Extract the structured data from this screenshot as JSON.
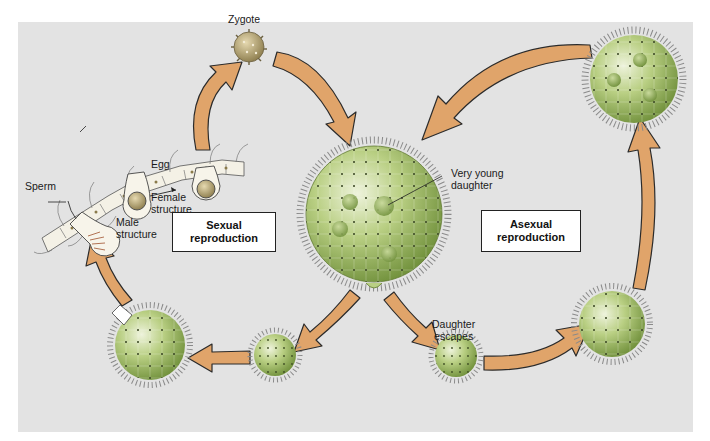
{
  "diagram": {
    "background_color": "#e3e3e3",
    "arrow_fill": "#e0a46a",
    "arrow_stroke": "#2b2b2b",
    "colony_fill": "#a9c46a",
    "colony_shade": "#6f8f3a",
    "cilia_color": "#7a7a7a",
    "daughter_fill": "#86a84c"
  },
  "labels": {
    "zygote": "Zygote",
    "egg": "Egg",
    "sperm": "Sperm",
    "female_structure_1": "Female",
    "female_structure_2": "structure",
    "male_structure_1": "Male",
    "male_structure_2": "structure",
    "very_young_daughter_1": "Very young",
    "very_young_daughter_2": "daughter",
    "daughter_escapes_1": "Daughter",
    "daughter_escapes_2": "escapes"
  },
  "boxes": {
    "sexual": {
      "line1": "Sexual",
      "line2": "reproduction"
    },
    "asexual": {
      "line1": "Asexual",
      "line2": "reproduction"
    }
  },
  "stages": [
    {
      "id": "zygote",
      "cx": 249,
      "cy": 47,
      "r": 16
    },
    {
      "id": "parent-colony",
      "cx": 374,
      "cy": 214,
      "r": 68
    },
    {
      "id": "daughter-escapes",
      "cx": 456,
      "cy": 356,
      "r": 22
    },
    {
      "id": "asexual-growing",
      "cx": 612,
      "cy": 324,
      "r": 34
    },
    {
      "id": "asexual-mature",
      "cx": 634,
      "cy": 79,
      "r": 44
    },
    {
      "id": "sexual-small",
      "cx": 275,
      "cy": 355,
      "r": 22
    },
    {
      "id": "sexual-mature",
      "cx": 150,
      "cy": 345,
      "r": 36
    }
  ]
}
